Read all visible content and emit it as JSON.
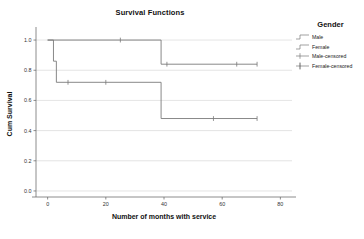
{
  "chart_data": {
    "type": "line",
    "title": "Survival Functions",
    "xlabel": "Number of months with service",
    "ylabel": "Cum Survival",
    "xlim": [
      -4,
      84
    ],
    "ylim": [
      -0.04,
      1.06
    ],
    "xticks": [
      0,
      20,
      40,
      60,
      80
    ],
    "xticklabels": [
      "0",
      "20",
      "40",
      "60",
      "80"
    ],
    "yticks": [
      0.0,
      0.2,
      0.4,
      0.6,
      0.8,
      1.0
    ],
    "yticklabels": [
      "0.0",
      "0.2",
      "0.4",
      "0.6",
      "0.8",
      "1.0"
    ],
    "grid": "horizontal",
    "legend": {
      "title": "Gender",
      "position": "right",
      "entries": [
        {
          "label": "Male",
          "key": "step-line"
        },
        {
          "label": "Female",
          "key": "step-line"
        },
        {
          "label": "Male-censored",
          "key": "plus-on-line"
        },
        {
          "label": "Female-censored",
          "key": "plus-on-line"
        }
      ]
    },
    "series": [
      {
        "name": "Male",
        "color": "#7a7a7a",
        "step_points": [
          {
            "x": 0,
            "y": 1.0
          },
          {
            "x": 39,
            "y": 1.0
          },
          {
            "x": 39,
            "y": 0.84
          },
          {
            "x": 72,
            "y": 0.84
          }
        ],
        "censored_marks": [
          {
            "x": 25,
            "y": 1.0
          },
          {
            "x": 41,
            "y": 0.84
          },
          {
            "x": 65,
            "y": 0.84
          },
          {
            "x": 72,
            "y": 0.84
          }
        ]
      },
      {
        "name": "Female",
        "color": "#7a7a7a",
        "step_points": [
          {
            "x": 0,
            "y": 1.0
          },
          {
            "x": 2,
            "y": 1.0
          },
          {
            "x": 2,
            "y": 0.86
          },
          {
            "x": 3,
            "y": 0.86
          },
          {
            "x": 3,
            "y": 0.72
          },
          {
            "x": 39,
            "y": 0.72
          },
          {
            "x": 39,
            "y": 0.48
          },
          {
            "x": 72,
            "y": 0.48
          }
        ],
        "censored_marks": [
          {
            "x": 7,
            "y": 0.72
          },
          {
            "x": 20,
            "y": 0.72
          },
          {
            "x": 57,
            "y": 0.48
          },
          {
            "x": 72,
            "y": 0.48
          }
        ]
      }
    ]
  }
}
